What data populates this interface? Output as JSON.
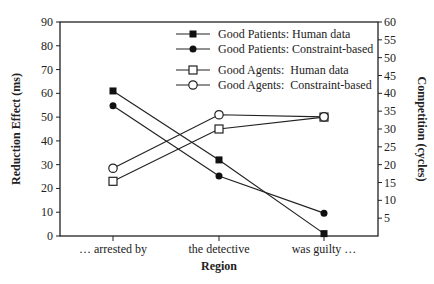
{
  "chart_data": {
    "type": "line",
    "title": "",
    "xlabel": "Region",
    "ylabel": "Reduction Effect (ms)",
    "y2label": "Competition (cycles)",
    "categories": [
      "… arrested by",
      "the detective",
      "was guilty …"
    ],
    "ylim": [
      0,
      90
    ],
    "y2lim": [
      0,
      60
    ],
    "yticks": [
      "0",
      "10",
      "20",
      "30",
      "40",
      "50",
      "60",
      "70",
      "80",
      "90"
    ],
    "y2ticks": [
      "5",
      "10",
      "15",
      "20",
      "25",
      "30",
      "35",
      "40",
      "45",
      "50",
      "55",
      "60"
    ],
    "grid": false,
    "legend_position": "top-right inside",
    "series": [
      {
        "name": "Good Patients: Human data",
        "axis": "left",
        "marker": "filled-square",
        "values": [
          61,
          32,
          1
        ]
      },
      {
        "name": "Good Patients: Constraint-based",
        "axis": "right",
        "marker": "filled-circle",
        "values": [
          36.5,
          16.8,
          6.4
        ]
      },
      {
        "name": "Good Agents:  Human data",
        "axis": "left",
        "marker": "open-square",
        "values": [
          23,
          45,
          50
        ]
      },
      {
        "name": "Good Agents:  Constraint-based",
        "axis": "right",
        "marker": "open-circle",
        "values": [
          19,
          34,
          33.4
        ]
      }
    ]
  }
}
